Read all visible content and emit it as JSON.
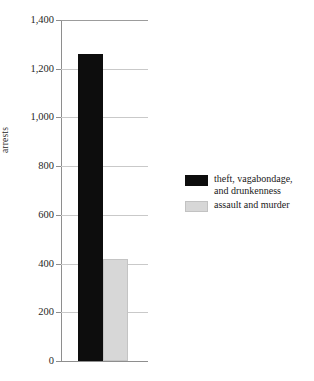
{
  "chart_data": {
    "type": "bar",
    "title": "",
    "xlabel": "",
    "ylabel": "arrests",
    "ylim": [
      0,
      1400
    ],
    "ytick_step": 200,
    "grid": true,
    "legend_position": "right",
    "categories": [
      ""
    ],
    "ytick_labels": [
      "1,400",
      "1,200",
      "1,000",
      "800",
      "600",
      "400",
      "200",
      "0"
    ],
    "ytick_values": [
      1400,
      1200,
      1000,
      800,
      600,
      400,
      200,
      0
    ],
    "series": [
      {
        "name": "theft, vagabondage, and drunkenness",
        "color": "#0d0d0d",
        "values": [
          1260
        ]
      },
      {
        "name": "assault and murder",
        "color": "#d7d7d7",
        "values": [
          420
        ]
      }
    ]
  },
  "legend": {
    "entries": [
      {
        "label": "theft, vagabondage,\nand drunkenness",
        "swatch": "black-swatch"
      },
      {
        "label": "assault and murder",
        "swatch": "gray-swatch"
      }
    ]
  },
  "axis": {
    "y_title": "arrests"
  },
  "colors": {
    "series_black": "#0d0d0d",
    "series_gray": "#d7d7d7",
    "gridline": "#c9c9c9",
    "spine": "#8e8e8e",
    "background": "#ffffff",
    "text": "#1a1a1a"
  }
}
